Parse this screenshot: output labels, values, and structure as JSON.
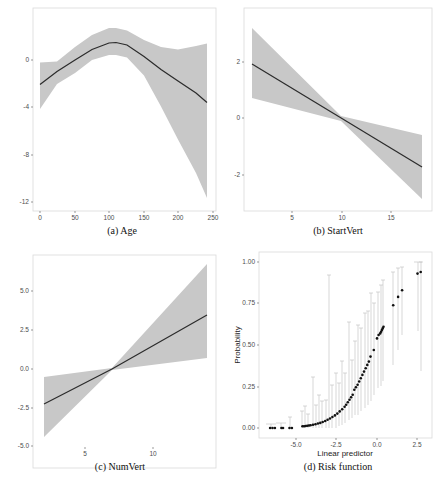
{
  "chart_data": [
    {
      "id": "a",
      "type": "line",
      "caption": "(a) Age",
      "xlabel": "",
      "ylabel": "",
      "xticks": [
        0,
        50,
        100,
        150,
        200,
        250
      ],
      "yticks": [
        0,
        -4,
        -8,
        -12
      ],
      "xlim": [
        -8,
        252
      ],
      "ylim": [
        -12.8,
        3.6
      ],
      "grid": false,
      "series": [
        {
          "name": "smooth effect",
          "x": [
            0,
            25,
            50,
            75,
            100,
            110,
            125,
            150,
            175,
            200,
            225,
            242
          ],
          "y": [
            -2.1,
            -1.0,
            0.0,
            0.9,
            1.45,
            1.5,
            1.3,
            0.3,
            -0.8,
            -1.8,
            -2.8,
            -3.6
          ]
        },
        {
          "name": "ci_upper",
          "x": [
            0,
            25,
            50,
            75,
            100,
            110,
            125,
            150,
            175,
            200,
            225,
            242
          ],
          "y": [
            -0.2,
            -0.1,
            1.1,
            2.1,
            2.7,
            2.7,
            2.5,
            1.7,
            1.1,
            0.9,
            1.2,
            1.4
          ]
        },
        {
          "name": "ci_lower",
          "x": [
            0,
            25,
            50,
            75,
            100,
            110,
            125,
            150,
            175,
            200,
            225,
            242
          ],
          "y": [
            -4.3,
            -2.2,
            -1.2,
            -0.1,
            0.3,
            0.3,
            0.1,
            -1.4,
            -4.0,
            -6.8,
            -9.6,
            -11.7
          ]
        }
      ]
    },
    {
      "id": "b",
      "type": "line",
      "caption": "(b) StartVert",
      "xlabel": "",
      "ylabel": "",
      "xticks": [
        5,
        10,
        15
      ],
      "yticks": [
        2,
        0,
        -2
      ],
      "xlim": [
        0.1,
        19.1
      ],
      "ylim": [
        -3.3,
        3.8
      ],
      "grid": false,
      "series": [
        {
          "name": "smooth effect",
          "x": [
            1,
            10,
            18
          ],
          "y": [
            1.9,
            0.0,
            -1.7
          ]
        },
        {
          "name": "ci_upper",
          "x": [
            1,
            10,
            18
          ],
          "y": [
            3.2,
            0.1,
            -0.6
          ]
        },
        {
          "name": "ci_lower",
          "x": [
            1,
            10,
            18
          ],
          "y": [
            0.7,
            -0.1,
            -2.85
          ]
        }
      ]
    },
    {
      "id": "c",
      "type": "line",
      "caption": "(c) NumVert",
      "xlabel": "",
      "ylabel": "",
      "xticks": [
        5,
        10
      ],
      "yticks": [
        5.0,
        2.5,
        0.0,
        -2.5,
        -5.0
      ],
      "xlim": [
        1.2,
        14.7
      ],
      "ylim": [
        -5.1,
        8.3
      ],
      "grid": false,
      "series": [
        {
          "name": "smooth effect",
          "x": [
            2,
            7,
            14
          ],
          "y": [
            -2.25,
            0.0,
            3.45
          ]
        },
        {
          "name": "ci_upper",
          "x": [
            2,
            7,
            14
          ],
          "y": [
            -0.5,
            0.1,
            6.8
          ]
        },
        {
          "name": "ci_lower",
          "x": [
            2,
            7,
            14
          ],
          "y": [
            -4.45,
            -0.1,
            0.7
          ]
        }
      ]
    },
    {
      "id": "d",
      "type": "scatter",
      "caption": "(d) Risk function",
      "xlabel": "Linear predictor",
      "ylabel": "Probability",
      "xticks": [
        -5.0,
        -2.5,
        0.0,
        2.5
      ],
      "yticks": [
        0.0,
        0.25,
        0.5,
        0.75,
        1.0
      ],
      "xlim": [
        -7.3,
        3.4
      ],
      "ylim": [
        -0.05,
        1.04
      ],
      "grid": false,
      "series": [
        {
          "name": "fitted probability",
          "x": [
            -6.6,
            -6.45,
            -6.3,
            -5.9,
            -5.8,
            -5.4,
            -5.25,
            -4.6,
            -4.5,
            -4.4,
            -4.3,
            -4.2,
            -4.1,
            -3.95,
            -3.8,
            -3.65,
            -3.5,
            -3.35,
            -3.2,
            -3.05,
            -2.9,
            -2.75,
            -2.6,
            -2.45,
            -2.3,
            -2.15,
            -2.0,
            -1.9,
            -1.8,
            -1.7,
            -1.6,
            -1.5,
            -1.4,
            -1.3,
            -1.2,
            -1.1,
            -1.0,
            -0.9,
            -0.8,
            -0.7,
            -0.6,
            -0.5,
            -0.4,
            -0.2,
            0.0,
            0.1,
            0.2,
            0.25,
            0.3,
            0.35,
            0.4,
            1.0,
            1.3,
            1.55,
            2.5,
            2.7
          ],
          "y": [
            0.0,
            0.0,
            0.0,
            0.0,
            0.0,
            0.0,
            0.0,
            0.01,
            0.01,
            0.012,
            0.013,
            0.015,
            0.017,
            0.02,
            0.023,
            0.027,
            0.031,
            0.036,
            0.042,
            0.05,
            0.057,
            0.066,
            0.076,
            0.087,
            0.1,
            0.113,
            0.128,
            0.14,
            0.155,
            0.17,
            0.185,
            0.2,
            0.23,
            0.245,
            0.26,
            0.28,
            0.3,
            0.32,
            0.34,
            0.36,
            0.38,
            0.4,
            0.43,
            0.47,
            0.54,
            0.56,
            0.57,
            0.58,
            0.59,
            0.6,
            0.61,
            0.74,
            0.79,
            0.83,
            0.93,
            0.94
          ]
        }
      ],
      "errorbars": [
        {
          "x": -6.5,
          "lo": 0.0,
          "hi": 0.02
        },
        {
          "x": -5.9,
          "lo": 0.0,
          "hi": 0.03
        },
        {
          "x": -5.3,
          "lo": 0.0,
          "hi": 0.07
        },
        {
          "x": -4.6,
          "lo": 0.0,
          "hi": 0.1
        },
        {
          "x": -4.4,
          "lo": 0.0,
          "hi": 0.13
        },
        {
          "x": -4.2,
          "lo": 0.0,
          "hi": 0.08
        },
        {
          "x": -3.9,
          "lo": 0.0,
          "hi": 0.31
        },
        {
          "x": -3.7,
          "lo": 0.0,
          "hi": 0.14
        },
        {
          "x": -3.5,
          "lo": 0.0,
          "hi": 0.2
        },
        {
          "x": -3.3,
          "lo": 0.0,
          "hi": 0.16
        },
        {
          "x": -3.1,
          "lo": 0.0,
          "hi": 0.17
        },
        {
          "x": -2.9,
          "lo": 0.0,
          "hi": 0.92
        },
        {
          "x": -2.7,
          "lo": 0.0,
          "hi": 0.26
        },
        {
          "x": -2.5,
          "lo": 0.0,
          "hi": 0.33
        },
        {
          "x": -2.3,
          "lo": 0.01,
          "hi": 0.27
        },
        {
          "x": -2.1,
          "lo": 0.02,
          "hi": 0.4
        },
        {
          "x": -1.9,
          "lo": 0.03,
          "hi": 0.33
        },
        {
          "x": -1.7,
          "lo": 0.05,
          "hi": 0.64
        },
        {
          "x": -1.5,
          "lo": 0.06,
          "hi": 0.41
        },
        {
          "x": -1.3,
          "lo": 0.08,
          "hi": 0.52
        },
        {
          "x": -1.1,
          "lo": 0.08,
          "hi": 0.62
        },
        {
          "x": -0.9,
          "lo": 0.1,
          "hi": 0.6
        },
        {
          "x": -0.7,
          "lo": 0.12,
          "hi": 0.69
        },
        {
          "x": -0.5,
          "lo": 0.14,
          "hi": 0.7
        },
        {
          "x": -0.3,
          "lo": 0.16,
          "hi": 0.81
        },
        {
          "x": -0.1,
          "lo": 0.2,
          "hi": 0.75
        },
        {
          "x": 0.1,
          "lo": 0.24,
          "hi": 0.82
        },
        {
          "x": 0.3,
          "lo": 0.25,
          "hi": 0.86
        },
        {
          "x": 0.4,
          "lo": 0.28,
          "hi": 0.89
        },
        {
          "x": 1.0,
          "lo": 0.38,
          "hi": 0.94
        },
        {
          "x": 1.3,
          "lo": 0.47,
          "hi": 0.96
        },
        {
          "x": 1.55,
          "lo": 0.56,
          "hi": 0.97
        },
        {
          "x": 2.5,
          "lo": 0.58,
          "hi": 1.0
        },
        {
          "x": 2.7,
          "lo": 0.34,
          "hi": 1.0
        }
      ]
    }
  ],
  "panels": {
    "a": {
      "caption": "(a) Age",
      "yticks": [
        "0",
        "-4",
        "-8",
        "-12"
      ],
      "xticks": [
        "0",
        "50",
        "100",
        "150",
        "200",
        "250"
      ]
    },
    "b": {
      "caption": "(b) StartVert",
      "yticks": [
        "2",
        "0",
        "-2"
      ],
      "xticks": [
        "5",
        "10",
        "15"
      ]
    },
    "c": {
      "caption": "(c) NumVert",
      "yticks": [
        "5.0",
        "2.5",
        "0.0",
        "-2.5",
        "-5.0"
      ],
      "xticks": [
        "5",
        "10"
      ]
    },
    "d": {
      "caption": "(d) Risk function",
      "xlabel": "Linear predictor",
      "ylabel": "Probability",
      "yticks": [
        "1.00",
        "0.75",
        "0.50",
        "0.25",
        "0.00"
      ],
      "xticks": [
        "-5.0",
        "-2.5",
        "0.0",
        "2.5"
      ]
    }
  },
  "colors": {
    "band": "#c8c8c8",
    "line": "#2b2b2b",
    "frame": "#d9d9d9",
    "errorbar": "#bdbdbd",
    "point": "#111111"
  }
}
